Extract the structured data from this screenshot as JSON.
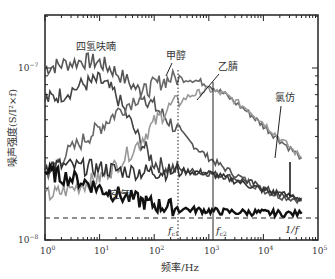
{
  "chart_data": {
    "type": "line",
    "title": "",
    "xlabel": "频率/Hz",
    "ylabel": "噪声强度(S/I²×f)",
    "xscale": "log",
    "yscale": "log",
    "xlim": [
      1,
      100000
    ],
    "ylim": [
      1e-08,
      2e-07
    ],
    "grid": false,
    "legend": "none (inline annotations)",
    "x_tick_labels": [
      "10⁰",
      "10¹",
      "10²",
      "10³",
      "10⁴",
      "10⁵"
    ],
    "y_tick_labels": [
      "10⁻⁸",
      "10⁻⁷"
    ],
    "x": [
      1,
      2,
      5,
      10,
      20,
      50,
      100,
      200,
      500,
      1000,
      2000,
      5000,
      10000,
      20000,
      50000
    ],
    "series": [
      {
        "name": "四氢呋喃",
        "color": "#555555",
        "values": [
          1e-07,
          1.05e-07,
          1.1e-07,
          1.08e-07,
          9.5e-08,
          7.5e-08,
          6e-08,
          4.8e-08,
          3.6e-08,
          3e-08,
          2.6e-08,
          2.2e-08,
          1.95e-08,
          1.8e-08,
          1.7e-08
        ]
      },
      {
        "name": "四氢呋喃 (lower trace)",
        "color": "#444444",
        "values": [
          6.5e-08,
          7e-08,
          8e-08,
          8.5e-08,
          7e-08,
          4e-08,
          2.8e-08,
          2.6e-08,
          2.5e-08,
          2.45e-08,
          2.35e-08,
          2.2e-08,
          2e-08,
          1.85e-08,
          1.7e-08
        ]
      },
      {
        "name": "甲醇",
        "color": "#666666",
        "values": [
          2.4e-08,
          3e-08,
          3.8e-08,
          4.5e-08,
          5.5e-08,
          6.8e-08,
          8e-08,
          8.7e-08,
          8.6e-08,
          8e-08,
          7e-08,
          5.6e-08,
          4.6e-08,
          3.8e-08,
          3e-08
        ]
      },
      {
        "name": "乙腈",
        "color": "#999999",
        "values": [
          1.8e-08,
          1.9e-08,
          2.1e-08,
          2.3e-08,
          2.7e-08,
          3.6e-08,
          4.8e-08,
          6e-08,
          7e-08,
          7.5e-08,
          7e-08,
          5.8e-08,
          4.8e-08,
          3.9e-08,
          3e-08
        ]
      },
      {
        "name": "氯仿",
        "color": "#333333",
        "values": [
          2.7e-08,
          2.7e-08,
          2.65e-08,
          2.6e-08,
          2.55e-08,
          2.5e-08,
          2.5e-08,
          2.5e-08,
          2.5e-08,
          2.45e-08,
          2.3e-08,
          2.1e-08,
          1.95e-08,
          1.85e-08,
          1.75e-08
        ]
      },
      {
        "name": "空气",
        "color": "#111111",
        "values": [
          2.5e-08,
          2.35e-08,
          2.2e-08,
          2e-08,
          1.85e-08,
          1.7e-08,
          1.6e-08,
          1.55e-08,
          1.5e-08,
          1.48e-08,
          1.46e-08,
          1.45e-08,
          1.44e-08,
          1.43e-08,
          1.42e-08
        ]
      }
    ],
    "reference_lines": [
      {
        "type": "horizontal",
        "style": "dashed",
        "y": 1.34e-08,
        "label": ""
      },
      {
        "type": "vertical",
        "style": "dotted",
        "x": 250,
        "label": "f_c1"
      },
      {
        "type": "vertical",
        "style": "solid",
        "x": 1100,
        "label": "f_c2"
      },
      {
        "type": "vertical",
        "style": "solid",
        "x": 30000,
        "label": "1/f"
      }
    ],
    "annotations": [
      "四氢呋喃",
      "甲醇",
      "乙腈",
      "氯仿",
      "空气",
      "f_c1",
      "f_c2",
      "1/f"
    ]
  },
  "labels": {
    "xlabel": "频率/Hz",
    "ylabel": "噪声强度(S/I²×f)",
    "y_top": "10",
    "y_top_exp": "−7",
    "y_bottom": "10",
    "y_bottom_exp": "−8",
    "x_ticks": [
      {
        "base": "10",
        "exp": "0"
      },
      {
        "base": "10",
        "exp": "1"
      },
      {
        "base": "10",
        "exp": "2"
      },
      {
        "base": "10",
        "exp": "3"
      },
      {
        "base": "10",
        "exp": "4"
      },
      {
        "base": "10",
        "exp": "5"
      }
    ],
    "annot_thf": "四氢呋喃",
    "annot_methanol": "甲醇",
    "annot_acetonitrile": "乙腈",
    "annot_chloroform": "氯仿",
    "annot_air": "空气",
    "annot_fc1": "f",
    "annot_fc1_sub": "c1",
    "annot_fc2": "f",
    "annot_fc2_sub": "c2",
    "annot_1f": "1/f"
  }
}
